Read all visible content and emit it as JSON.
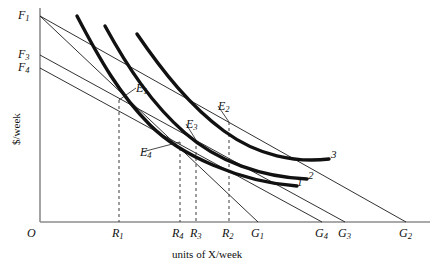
{
  "chart_data": {
    "type": "line",
    "title": "",
    "xlabel": "units of X/week",
    "ylabel": "$/week",
    "grid": false,
    "legend_position": "inline-right",
    "axes": {
      "origin_label": "O",
      "x_axis_px": {
        "x0": 40,
        "x1": 430,
        "y": 222
      },
      "y_axis_px": {
        "x": 40,
        "y0": 8,
        "y1": 222
      }
    },
    "vertical_intercepts": [
      {
        "name": "F1",
        "base": "F",
        "sub": "1",
        "y_px": 16
      },
      {
        "name": "F3",
        "base": "F",
        "sub": "3",
        "y_px": 55
      },
      {
        "name": "F4",
        "base": "F",
        "sub": "4",
        "y_px": 68
      }
    ],
    "horizontal_intercepts": [
      {
        "name": "G1",
        "base": "G",
        "sub": "1",
        "x_px": 258
      },
      {
        "name": "G4",
        "base": "G",
        "sub": "4",
        "x_px": 322
      },
      {
        "name": "G3",
        "base": "G",
        "sub": "3",
        "x_px": 345
      },
      {
        "name": "G2",
        "base": "G",
        "sub": "2",
        "x_px": 406
      }
    ],
    "quantity_ticks": [
      {
        "name": "R1",
        "base": "R",
        "sub": "1",
        "x_px": 119
      },
      {
        "name": "R4",
        "base": "R",
        "sub": "4",
        "x_px": 180
      },
      {
        "name": "R3",
        "base": "R",
        "sub": "3",
        "x_px": 196
      },
      {
        "name": "R2",
        "base": "R",
        "sub": "2",
        "x_px": 229
      }
    ],
    "equilibria": [
      {
        "name": "E1",
        "base": "E",
        "sub": "1",
        "label_px": {
          "x": 136,
          "y": 88
        },
        "point_px": {
          "x": 119,
          "y": 100
        }
      },
      {
        "name": "E2",
        "base": "E",
        "sub": "2",
        "label_px": {
          "x": 218,
          "y": 106
        },
        "point_px": {
          "x": 229,
          "y": 122
        }
      },
      {
        "name": "E3",
        "base": "E",
        "sub": "3",
        "label_px": {
          "x": 186,
          "y": 124
        },
        "point_px": {
          "x": 196,
          "y": 140
        }
      },
      {
        "name": "E4",
        "base": "E",
        "sub": "4",
        "label_px": {
          "x": 142,
          "y": 152
        },
        "point_px": {
          "x": 180,
          "y": 142
        }
      }
    ],
    "curve_labels": [
      {
        "name": "3",
        "x_px": 331,
        "y_px": 155
      },
      {
        "name": "2",
        "x_px": 308,
        "y_px": 176
      },
      {
        "name": "1",
        "x_px": 298,
        "y_px": 182
      }
    ],
    "budget_lines": [
      {
        "from": "F1",
        "to": "G1",
        "x0": 40,
        "y0": 16,
        "x1": 258,
        "y1": 222
      },
      {
        "from": "F1",
        "to": "G2",
        "x0": 40,
        "y0": 16,
        "x1": 406,
        "y1": 222
      },
      {
        "from": "F3",
        "to": "G3",
        "x0": 40,
        "y0": 55,
        "x1": 345,
        "y1": 222
      },
      {
        "from": "F4",
        "to": "G4",
        "x0": 40,
        "y0": 68,
        "x1": 322,
        "y1": 222
      }
    ],
    "indifference_curves": [
      {
        "name": "1",
        "path": "M 77 16 C 100 60, 120 95, 150 125 C 180 155, 240 182, 297 186"
      },
      {
        "name": "2",
        "path": "M 105 26 C 128 68, 152 104, 185 133 C 218 162, 262 177, 307 179"
      },
      {
        "name": "3",
        "path": "M 137 34 C 163 72, 190 106, 224 131 C 258 156, 296 163, 329 159"
      }
    ]
  }
}
